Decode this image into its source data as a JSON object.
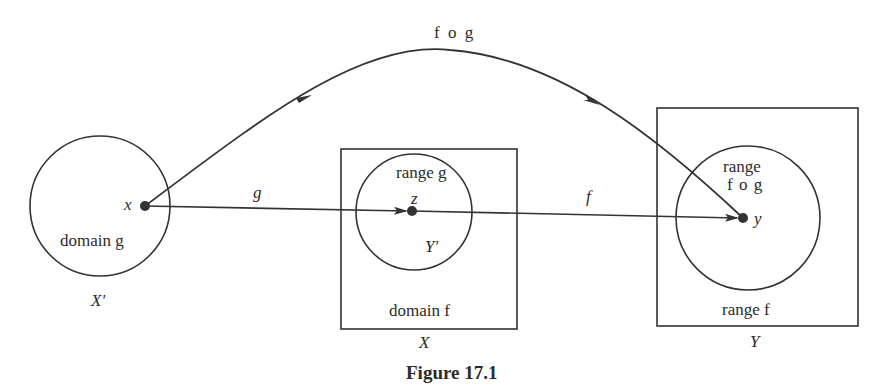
{
  "figure": {
    "caption": "Figure 17.1",
    "composition_label": "f o g",
    "sets": {
      "x_prime": {
        "set_label": "X′",
        "circle_label": "domain g"
      },
      "x": {
        "set_label": "X",
        "circle_label": "range g",
        "inner_label": "Y′",
        "box_label": "domain f"
      },
      "y": {
        "set_label": "Y",
        "circle_label_line1": "range",
        "circle_label_line2": "f o g",
        "box_label": "range f"
      }
    },
    "points": {
      "x": "x",
      "z": "z",
      "y": "y"
    },
    "arrows": {
      "g": "g",
      "f": "f",
      "fog": "f o g"
    },
    "stroke_color": "#333333"
  }
}
